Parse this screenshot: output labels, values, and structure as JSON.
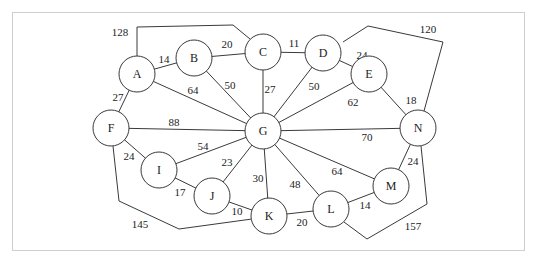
{
  "graph": {
    "nodes": [
      {
        "id": "A",
        "x": 137,
        "y": 74
      },
      {
        "id": "B",
        "x": 194,
        "y": 58
      },
      {
        "id": "C",
        "x": 263,
        "y": 52
      },
      {
        "id": "D",
        "x": 323,
        "y": 53
      },
      {
        "id": "E",
        "x": 369,
        "y": 74
      },
      {
        "id": "F",
        "x": 111,
        "y": 128
      },
      {
        "id": "G",
        "x": 263,
        "y": 131
      },
      {
        "id": "N",
        "x": 418,
        "y": 128
      },
      {
        "id": "I",
        "x": 159,
        "y": 170
      },
      {
        "id": "J",
        "x": 212,
        "y": 196
      },
      {
        "id": "K",
        "x": 269,
        "y": 216
      },
      {
        "id": "L",
        "x": 331,
        "y": 209
      },
      {
        "id": "M",
        "x": 391,
        "y": 186
      }
    ],
    "node_radius": 18,
    "edges": [
      {
        "from": "A",
        "to": "B",
        "weight": "14",
        "lx": 164,
        "ly": 59,
        "points": null
      },
      {
        "from": "A",
        "to": "C",
        "weight": "128",
        "lx": 120,
        "ly": 32,
        "points": [
          [
            137,
            56
          ],
          [
            137,
            27
          ],
          [
            233,
            25
          ],
          [
            250,
            39
          ]
        ]
      },
      {
        "from": "B",
        "to": "C",
        "weight": "20",
        "lx": 227,
        "ly": 44,
        "points": null
      },
      {
        "from": "C",
        "to": "D",
        "weight": "11",
        "lx": 294,
        "ly": 43,
        "points": null
      },
      {
        "from": "D",
        "to": "E",
        "weight": "24",
        "lx": 362,
        "ly": 55,
        "points": null
      },
      {
        "from": "D",
        "to": "N",
        "weight": "120",
        "lx": 428,
        "ly": 29,
        "points": [
          [
            343,
            42
          ],
          [
            368,
            26
          ],
          [
            443,
            42
          ],
          [
            424,
            111
          ]
        ]
      },
      {
        "from": "E",
        "to": "N",
        "weight": "18",
        "lx": 411,
        "ly": 100,
        "points": null
      },
      {
        "from": "A",
        "to": "F",
        "weight": "27",
        "lx": 118,
        "ly": 97,
        "points": null
      },
      {
        "from": "A",
        "to": "G",
        "weight": "64",
        "lx": 193,
        "ly": 90,
        "points": null
      },
      {
        "from": "B",
        "to": "G",
        "weight": "50",
        "lx": 230,
        "ly": 85,
        "points": null
      },
      {
        "from": "C",
        "to": "G",
        "weight": "27",
        "lx": 270,
        "ly": 89,
        "points": null
      },
      {
        "from": "D",
        "to": "G",
        "weight": "50",
        "lx": 314,
        "ly": 86,
        "points": null
      },
      {
        "from": "E",
        "to": "G",
        "weight": "62",
        "lx": 353,
        "ly": 102,
        "points": null
      },
      {
        "from": "F",
        "to": "G",
        "weight": "88",
        "lx": 174,
        "ly": 122,
        "points": null
      },
      {
        "from": "G",
        "to": "N",
        "weight": "70",
        "lx": 367,
        "ly": 137,
        "points": null
      },
      {
        "from": "F",
        "to": "I",
        "weight": "24",
        "lx": 129,
        "ly": 156,
        "points": null
      },
      {
        "from": "F",
        "to": "K",
        "weight": "145",
        "lx": 140,
        "ly": 224,
        "points": [
          [
            113,
            146
          ],
          [
            119,
            201
          ],
          [
            179,
            229
          ],
          [
            252,
            219
          ]
        ]
      },
      {
        "from": "I",
        "to": "G",
        "weight": "54",
        "lx": 203,
        "ly": 146,
        "points": null
      },
      {
        "from": "I",
        "to": "J",
        "weight": "17",
        "lx": 180,
        "ly": 192,
        "points": null
      },
      {
        "from": "J",
        "to": "G",
        "weight": "23",
        "lx": 227,
        "ly": 162,
        "points": null
      },
      {
        "from": "J",
        "to": "K",
        "weight": "10",
        "lx": 237,
        "ly": 211,
        "points": null
      },
      {
        "from": "G",
        "to": "K",
        "weight": "30",
        "lx": 258,
        "ly": 178,
        "points": null
      },
      {
        "from": "G",
        "to": "L",
        "weight": "48",
        "lx": 295,
        "ly": 184,
        "points": null
      },
      {
        "from": "G",
        "to": "M",
        "weight": "64",
        "lx": 337,
        "ly": 171,
        "points": null
      },
      {
        "from": "K",
        "to": "L",
        "weight": "20",
        "lx": 302,
        "ly": 222,
        "points": null
      },
      {
        "from": "L",
        "to": "M",
        "weight": "14",
        "lx": 365,
        "ly": 205,
        "points": null
      },
      {
        "from": "M",
        "to": "N",
        "weight": "24",
        "lx": 413,
        "ly": 161,
        "points": null
      },
      {
        "from": "L",
        "to": "N",
        "weight": "157",
        "lx": 413,
        "ly": 226,
        "points": [
          [
            344,
            222
          ],
          [
            367,
            239
          ],
          [
            427,
            204
          ],
          [
            421,
            146
          ]
        ]
      }
    ]
  }
}
